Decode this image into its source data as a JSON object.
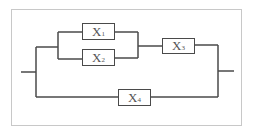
{
  "diagram": {
    "type": "reliability-block-diagram",
    "components": [
      {
        "id": "X1",
        "label": "X",
        "subscript": "1"
      },
      {
        "id": "X2",
        "label": "X",
        "subscript": "2"
      },
      {
        "id": "X3",
        "label": "X",
        "subscript": "3"
      },
      {
        "id": "X4",
        "label": "X",
        "subscript": "4"
      }
    ],
    "structure": "((X1 || X2) -> X3) || X4",
    "colors": {
      "line": "#4a4a4a",
      "frame": "#c8c8c8",
      "text": "#555555"
    }
  }
}
